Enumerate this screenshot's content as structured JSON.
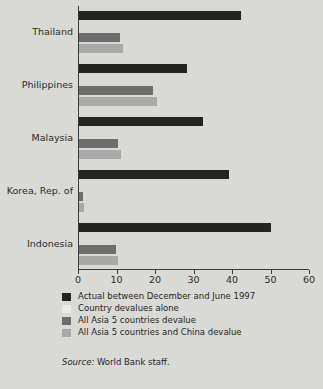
{
  "chart_data": {
    "type": "bar",
    "orientation": "horizontal",
    "title": "",
    "xlabel": "",
    "ylabel": "",
    "xlim": [
      0,
      60
    ],
    "xticks": [
      0,
      10,
      20,
      30,
      40,
      50,
      60
    ],
    "grid": false,
    "legend_position": "below-plot",
    "categories": [
      "Thailand",
      "Philippines",
      "Malaysia",
      "Korea, Rep. of",
      "Indonesia"
    ],
    "series": [
      {
        "name": "Actual between December and June 1997",
        "color": "#232323",
        "values": [
          42.3,
          28.2,
          32.5,
          39.2,
          50.0
        ]
      },
      {
        "name": "Country devalues alone",
        "color": "#ebebe7",
        "values": [
          0,
          0,
          0,
          0,
          0
        ]
      },
      {
        "name": "All Asia 5 countries devalue",
        "color": "#6d6d6d",
        "values": [
          11.0,
          19.5,
          10.5,
          1.2,
          9.8
        ]
      },
      {
        "name": "All Asia 5 countries and China devalue",
        "color": "#a9a9a9",
        "values": [
          11.8,
          20.6,
          11.2,
          1.6,
          10.4
        ]
      }
    ]
  },
  "legend": {
    "items": [
      {
        "label": "Actual between December and June 1997",
        "color": "#232323"
      },
      {
        "label": "Country devalues alone",
        "color": "#ebebe7"
      },
      {
        "label": "All Asia 5 countries devalue",
        "color": "#6d6d6d"
      },
      {
        "label": "All Asia 5 countries and China devalue",
        "color": "#a9a9a9"
      }
    ]
  },
  "source": {
    "prefix": "Source:",
    "text": "World Bank staff."
  }
}
